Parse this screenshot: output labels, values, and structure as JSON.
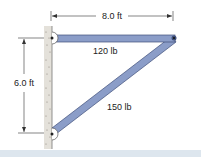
{
  "diagram": {
    "width_label": "8.0 ft",
    "height_label": "6.0 ft",
    "horizontal_beam_label": "120 lb",
    "diagonal_strut_label": "150 lb",
    "colors": {
      "beam": "#8b9dc8",
      "beam_edge": "#3f4f7a",
      "wall": "#d8d4cc",
      "dimension": "#333333",
      "footer": "#dde6ee"
    }
  }
}
